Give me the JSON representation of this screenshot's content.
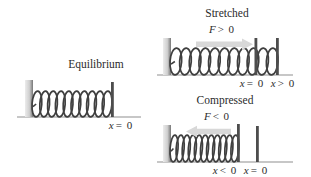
{
  "figure": {
    "panels": {
      "equilibrium": {
        "title": "Equilibrium",
        "coils": 10,
        "axis_labels": [
          {
            "v": "x",
            "rest": "= 0"
          }
        ]
      },
      "stretched": {
        "title": "Stretched",
        "force_label": {
          "v": "F",
          "rest": "> 0"
        },
        "coils": 11,
        "axis_labels": [
          {
            "v": "x",
            "rest": "= 0"
          },
          {
            "v": "x",
            "rest": "> 0"
          }
        ]
      },
      "compressed": {
        "title": "Compressed",
        "force_label": {
          "v": "F",
          "rest": "< 0"
        },
        "coils": 11,
        "axis_labels": [
          {
            "v": "x",
            "rest": "< 0"
          },
          {
            "v": "x",
            "rest": "= 0"
          }
        ]
      }
    },
    "colors": {
      "text": "#2b2b2b",
      "spring": "#3f3f3f",
      "post_light": "#ececec",
      "post_mid": "#cfcfcf",
      "post_dark": "#777777",
      "bar": "#4d4d4d",
      "baseline": "#8f8f8f",
      "arrow": "#d8d8d8"
    }
  }
}
